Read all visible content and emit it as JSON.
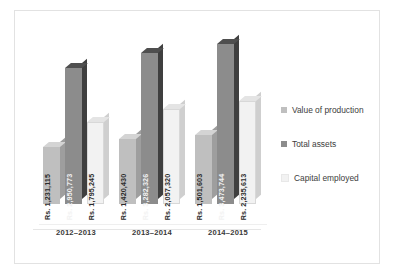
{
  "chart_data": {
    "type": "bar",
    "title": "",
    "subtitle": "",
    "xlabel": "",
    "ylabel": "",
    "grid": false,
    "legend_position": "right",
    "categories": [
      "2012–2013",
      "2013–2014",
      "2014–2015"
    ],
    "series": [
      {
        "name": "Value of production",
        "color": "#bfbfbf",
        "side_color": "#9e9e9e",
        "top_color": "#d4d4d4",
        "values": [
          1231115,
          2950773,
          1795245
        ],
        "labels": [
          "Rs. 1,231,115",
          "Rs. 1,420,430",
          "Rs. 1,501,603"
        ]
      },
      {
        "name": "Total assets",
        "color": "#8c8c8c",
        "side_color": "#3f3f3f",
        "top_color": "#4f4f4f",
        "values": [
          2950773,
          3282326,
          3473744
        ],
        "labels": [
          "Rs. 2,950,773",
          "Rs. 3,282,326",
          "Rs. 3,473,744"
        ]
      },
      {
        "name": "Capital employed",
        "color": "#f2f2f2",
        "side_color": "#cfcfcf",
        "top_color": "#e4e4e4",
        "values": [
          1795245,
          2057320,
          2235613
        ],
        "labels": [
          "Rs. 1,795,245",
          "Rs. 2,057,320",
          "Rs. 2,235,613"
        ]
      }
    ],
    "groups": [
      {
        "category": "2012–2013",
        "bars": [
          {
            "series": "Value of production",
            "value": 1231115,
            "label": "Rs. 1,231,115"
          },
          {
            "series": "Total assets",
            "value": 2950773,
            "label": "Rs. 2,950,773"
          },
          {
            "series": "Capital employed",
            "value": 1795245,
            "label": "Rs. 1,795,245"
          }
        ]
      },
      {
        "category": "2013–2014",
        "bars": [
          {
            "series": "Value of production",
            "value": 1420430,
            "label": "Rs. 1,420,430"
          },
          {
            "series": "Total assets",
            "value": 3282326,
            "label": "Rs. 3,282,326"
          },
          {
            "series": "Capital employed",
            "value": 2057320,
            "label": "Rs. 2,057,320"
          }
        ]
      },
      {
        "category": "2014–2015",
        "bars": [
          {
            "series": "Value of production",
            "value": 1501603,
            "label": "Rs. 1,501,603"
          },
          {
            "series": "Total assets",
            "value": 3473744,
            "label": "Rs. 3,473,744"
          },
          {
            "series": "Capital employed",
            "value": 2235613,
            "label": "Rs. 2,235,613"
          }
        ]
      }
    ],
    "ylim": [
      0,
      3700000
    ],
    "value_prefix": "Rs. "
  },
  "legend": {
    "items": [
      {
        "label": "Value of production",
        "color": "#bfbfbf"
      },
      {
        "label": "Total assets",
        "color": "#8c8c8c"
      },
      {
        "label": "Capital employed",
        "color": "#f2f2f2"
      }
    ]
  },
  "axis": {
    "categories": [
      "2012–2013",
      "2013–2014",
      "2014–2015"
    ]
  }
}
